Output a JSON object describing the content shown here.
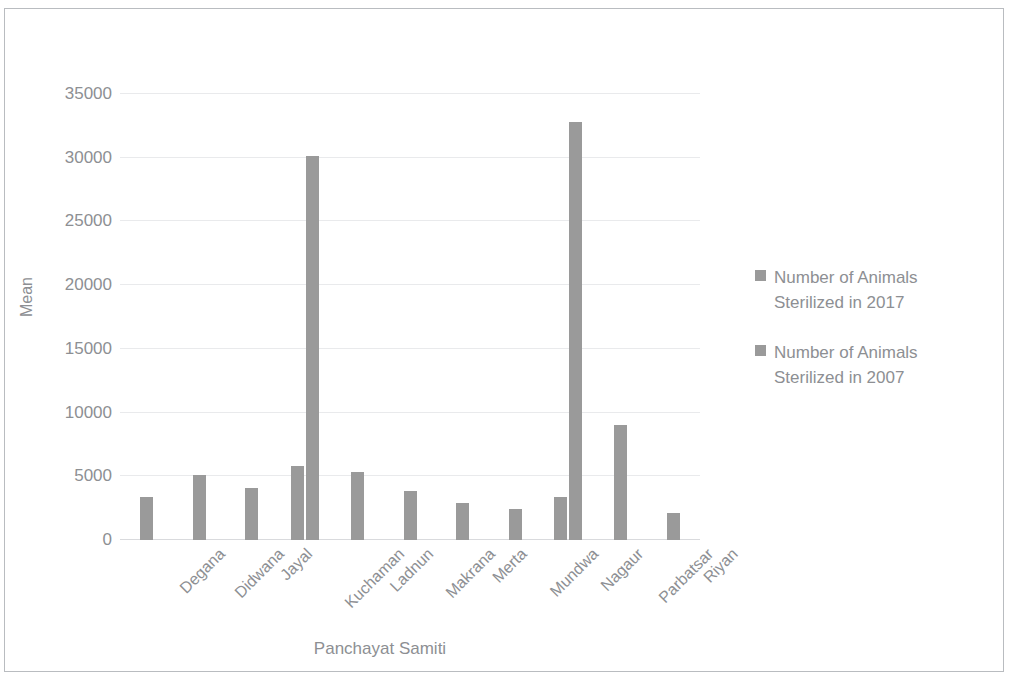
{
  "chart_data": {
    "type": "bar",
    "title": "",
    "xlabel": "Panchayat Samiti",
    "ylabel": "Mean",
    "ylim": [
      0,
      35000
    ],
    "yticks": [
      0,
      5000,
      10000,
      15000,
      20000,
      25000,
      30000,
      35000
    ],
    "ytick_labels": [
      "0",
      "5000",
      "10000",
      "15000",
      "20000",
      "25000",
      "30000",
      "35000"
    ],
    "grid": true,
    "legend_position": "right",
    "bar_color": "#9a9a9a",
    "categories": [
      "Degana",
      "Didwana",
      "Jayal",
      "Kuchaman",
      "Ladnun",
      "Makrana",
      "Merta",
      "Mundwa",
      "Nagaur",
      "Parbatsar",
      "Riyan"
    ],
    "series": [
      {
        "name": "Number of Animals Sterilized in 2017",
        "values": [
          3400,
          5100,
          4050,
          5800,
          5350,
          3850,
          2900,
          2450,
          3400,
          9000,
          2100
        ]
      },
      {
        "name": "Number of Animals Sterilized in 2007",
        "values": [
          0,
          0,
          0,
          30100,
          0,
          0,
          0,
          0,
          32800,
          0,
          0
        ]
      }
    ]
  },
  "legend": {
    "entries": [
      "Number of Animals Sterilized in 2017",
      "Number of Animals Sterilized in 2007"
    ]
  }
}
